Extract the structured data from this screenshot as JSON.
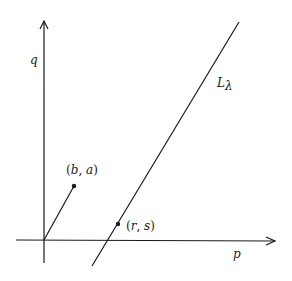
{
  "diagram": {
    "axes": {
      "x_label": "p",
      "y_label": "q"
    },
    "line": {
      "label_main": "L",
      "label_sub": "λ"
    },
    "points": {
      "ba": {
        "open": "(",
        "a": "b",
        "comma": ", ",
        "b": "a",
        "close": ")"
      },
      "rs": {
        "open": "(",
        "a": "r",
        "comma": ", ",
        "b": "s",
        "close": ")"
      }
    },
    "colors": {
      "stroke": "#1a1a1a",
      "background": "#ffffff"
    }
  }
}
